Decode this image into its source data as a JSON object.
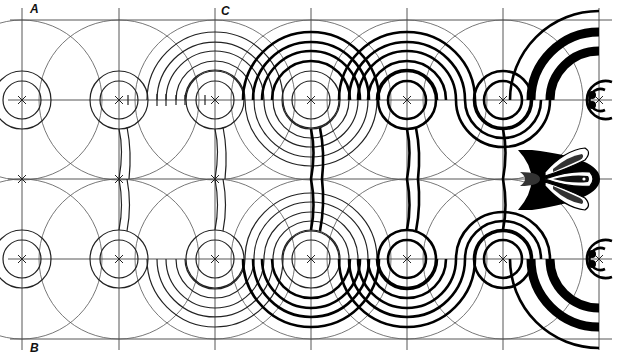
{
  "figure": {
    "labels": {
      "corner_top_left": "A",
      "corner_bottom_left": "B",
      "column_marker": "C"
    },
    "colors": {
      "background": "#ffffff",
      "ink": "#000000",
      "construction": "#555555"
    },
    "grid": {
      "columns_x": [
        22,
        119,
        215,
        311,
        407,
        503,
        599
      ],
      "rows_y": [
        20,
        100,
        179,
        259,
        339
      ],
      "band_top_y": 20,
      "band_bottom_y": 339,
      "center_rows_y": [
        100,
        259
      ],
      "midline_y": 179
    },
    "stages": [
      {
        "name": "construction-circles",
        "columns": [
          22,
          119
        ]
      },
      {
        "name": "concentric-arcs-thin",
        "columns": [
          215
        ]
      },
      {
        "name": "scroll-outline-thin",
        "columns": [
          311
        ]
      },
      {
        "name": "scroll-outline-bold",
        "columns": [
          407,
          503
        ]
      },
      {
        "name": "filled-scroll-with-palmette",
        "columns": [
          599
        ]
      }
    ]
  }
}
